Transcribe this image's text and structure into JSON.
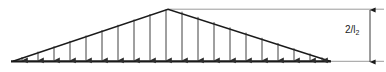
{
  "figure": {
    "kind": "structural-load-diagram",
    "colors": {
      "outline": "#1a1a1a",
      "arrow": "#2b2b2b",
      "baseline": "#1a1a1a",
      "dimension_line": "#8a8a8a",
      "extension_line": "#9a9a9a",
      "background": "#ffffff",
      "text": "#1a1a1a"
    }
  },
  "load": {
    "shape": "triangle",
    "apex": {
      "x": 168,
      "y": 9
    },
    "left_vertex": {
      "x": 13,
      "y": 61
    },
    "right_vertex": {
      "x": 330,
      "y": 61
    },
    "baseline_y": 61,
    "arrow_count": 20,
    "arrow_first_x": 22,
    "arrow_last_x": 322,
    "arrows": [
      {
        "x": 22,
        "top": 57.0
      },
      {
        "x": 38,
        "top": 51.6
      },
      {
        "x": 54,
        "top": 46.3
      },
      {
        "x": 70,
        "top": 40.9
      },
      {
        "x": 86,
        "top": 35.5
      },
      {
        "x": 102,
        "top": 30.2
      },
      {
        "x": 118,
        "top": 24.8
      },
      {
        "x": 134,
        "top": 19.5
      },
      {
        "x": 150,
        "top": 14.1
      },
      {
        "x": 166,
        "top": 9.4
      },
      {
        "x": 182,
        "top": 11.7
      },
      {
        "x": 198,
        "top": 16.9
      },
      {
        "x": 214,
        "top": 22.1
      },
      {
        "x": 230,
        "top": 27.4
      },
      {
        "x": 246,
        "top": 32.6
      },
      {
        "x": 262,
        "top": 37.8
      },
      {
        "x": 278,
        "top": 43.0
      },
      {
        "x": 294,
        "top": 48.3
      },
      {
        "x": 310,
        "top": 53.5
      },
      {
        "x": 322,
        "top": 57.4
      }
    ]
  },
  "dimension": {
    "label": "2/l",
    "label_subscript": "2",
    "label_full": "2/l₂",
    "line_x": 370,
    "top_y": 10,
    "bottom_y": 62,
    "top_extension": {
      "x1": 168,
      "x2": 384,
      "y": 9
    },
    "bottom_extension": {
      "x1": 330,
      "x2": 384,
      "y": 61
    },
    "label_position": {
      "x": 346,
      "y": 26
    }
  }
}
